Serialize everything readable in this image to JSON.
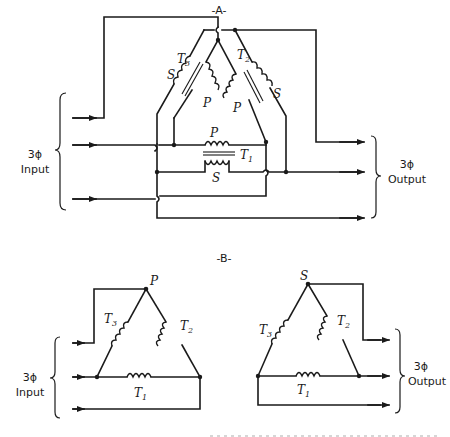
{
  "diagram": {
    "type": "electrical-schematic",
    "panels": [
      {
        "id": "A",
        "title": "-A-",
        "transformers": [
          {
            "name": "T",
            "sub": "1",
            "primary_label": "P",
            "secondary_label": "S"
          },
          {
            "name": "T",
            "sub": "2",
            "primary_label": "P",
            "secondary_label": "S"
          },
          {
            "name": "T",
            "sub": "3",
            "primary_label": "P",
            "secondary_label": "S"
          }
        ],
        "input_label": {
          "line1": "3ϕ",
          "line2": "Input"
        },
        "output_label": {
          "line1": "3ϕ",
          "line2": "Output"
        }
      },
      {
        "id": "B",
        "title": "-B-",
        "primary_delta": {
          "apex_label": "P",
          "windings": [
            {
              "name": "T",
              "sub": "3"
            },
            {
              "name": "T",
              "sub": "2"
            },
            {
              "name": "T",
              "sub": "1"
            }
          ]
        },
        "secondary_delta": {
          "apex_label": "S",
          "windings": [
            {
              "name": "T",
              "sub": "3"
            },
            {
              "name": "T",
              "sub": "2"
            },
            {
              "name": "T",
              "sub": "1"
            }
          ]
        },
        "input_label": {
          "line1": "3ϕ",
          "line2": "Input"
        },
        "output_label": {
          "line1": "3ϕ",
          "line2": "Output"
        }
      }
    ]
  },
  "colors": {
    "ink": "#1a1a1a",
    "background": "#ffffff"
  }
}
